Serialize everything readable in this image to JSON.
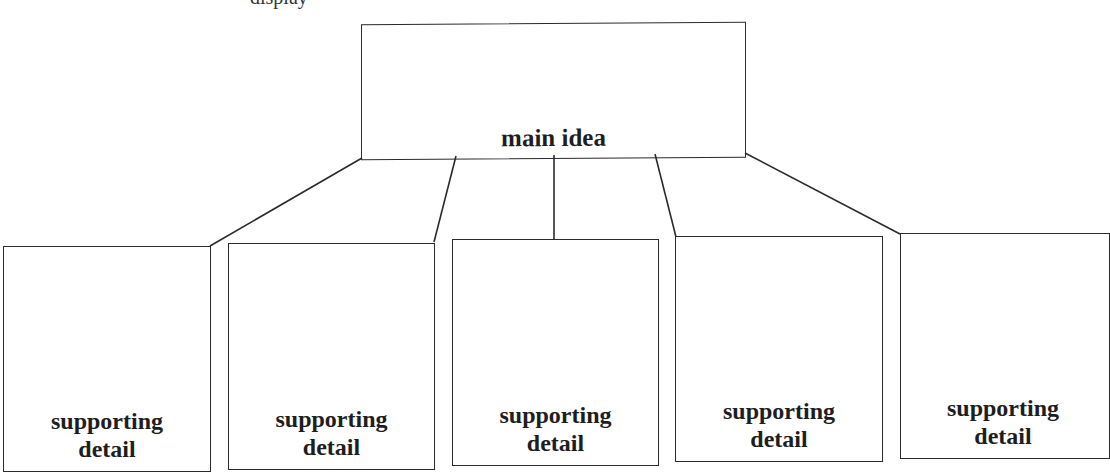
{
  "diagram": {
    "type": "hierarchy",
    "top_fragment": "display",
    "main": {
      "label": "main idea"
    },
    "details": [
      {
        "line1": "supporting",
        "line2": "detail"
      },
      {
        "line1": "supporting",
        "line2": "detail"
      },
      {
        "line1": "supporting",
        "line2": "detail"
      },
      {
        "line1": "supporting",
        "line2": "detail"
      },
      {
        "line1": "supporting",
        "line2": "detail"
      }
    ],
    "stroke_color": "#2b2b2b",
    "text_color": "#1e1e1e"
  }
}
